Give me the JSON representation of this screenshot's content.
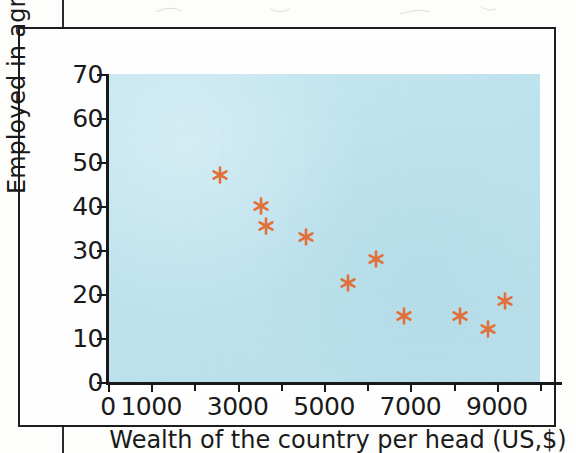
{
  "figure": {
    "background_color": "#bfe3ee",
    "marker_color": "#e2703a",
    "axis_color": "#191919"
  },
  "chart_data": {
    "type": "scatter",
    "title": "",
    "xlabel": "Wealth of the country per head (US,$)",
    "ylabel": "Employed in agriculture (%)",
    "xlim": [
      0,
      10000
    ],
    "ylim": [
      0,
      70
    ],
    "grid": false,
    "legend": null,
    "x_ticks": [
      0,
      1000,
      2000,
      3000,
      4000,
      5000,
      6000,
      7000,
      8000,
      9000,
      10000
    ],
    "x_tick_labels": [
      "0",
      "1000",
      "",
      "3000",
      "",
      "5000",
      "",
      "7000",
      "",
      "9000",
      ""
    ],
    "y_ticks": [
      0,
      10,
      20,
      30,
      40,
      50,
      60,
      70
    ],
    "y_tick_labels": [
      "0",
      "10",
      "20",
      "30",
      "40",
      "50",
      "60",
      "70"
    ],
    "marker_style": "asterisk",
    "points": [
      {
        "x": 2600,
        "y": 47
      },
      {
        "x": 3550,
        "y": 40
      },
      {
        "x": 3650,
        "y": 35.5
      },
      {
        "x": 4580,
        "y": 33
      },
      {
        "x": 5550,
        "y": 22.5
      },
      {
        "x": 6200,
        "y": 28
      },
      {
        "x": 6850,
        "y": 15
      },
      {
        "x": 8150,
        "y": 15
      },
      {
        "x": 8800,
        "y": 12
      },
      {
        "x": 9200,
        "y": 18.5
      }
    ]
  }
}
